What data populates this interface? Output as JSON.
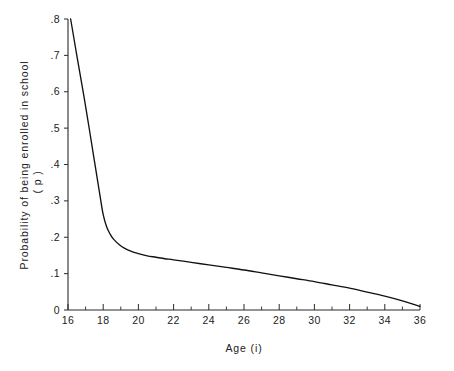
{
  "figure": {
    "background_color": "#ffffff",
    "line_color": "#111111",
    "axis_color": "#2a2a2a"
  },
  "axes": {
    "x_title": "Age (i)",
    "y_title_line1": "Probability of being enrolled in school",
    "y_title_line2": "( p )",
    "x_tick_labels": [
      "16",
      "18",
      "20",
      "22",
      "24",
      "26",
      "28",
      "30",
      "32",
      "34",
      "36"
    ],
    "y_tick_labels": [
      "0",
      ".1",
      ".2",
      ".3",
      ".4",
      ".5",
      ".6",
      ".7",
      ".8"
    ]
  },
  "chart_data": {
    "type": "line",
    "title": "",
    "xlabel": "Age (i)",
    "ylabel": "Probability of being enrolled in school ( p )",
    "xlim": [
      16,
      36
    ],
    "ylim": [
      0,
      0.8
    ],
    "grid": false,
    "legend": false,
    "x_major_ticks": [
      16,
      18,
      20,
      22,
      24,
      26,
      28,
      30,
      32,
      34,
      36
    ],
    "x_minor_ticks": [
      17,
      19,
      21,
      23,
      25,
      27,
      29,
      31,
      33,
      35
    ],
    "y_major_ticks": [
      0,
      0.1,
      0.2,
      0.3,
      0.4,
      0.5,
      0.6,
      0.7,
      0.8
    ],
    "series": [
      {
        "name": "Probability of being enrolled in school",
        "x": [
          16.15,
          16.5,
          17.0,
          17.5,
          17.8,
          18.0,
          18.2,
          18.4,
          18.6,
          18.9,
          19.2,
          19.6,
          20.0,
          20.5,
          21.0,
          21.5,
          22.0,
          23.0,
          24.0,
          25.0,
          26.0,
          27.0,
          28.0,
          29.0,
          30.0,
          31.0,
          32.0,
          33.0,
          34.0,
          35.0,
          36.0
        ],
        "y": [
          0.8,
          0.7,
          0.56,
          0.41,
          0.32,
          0.262,
          0.228,
          0.208,
          0.194,
          0.18,
          0.17,
          0.161,
          0.155,
          0.149,
          0.145,
          0.141,
          0.138,
          0.131,
          0.124,
          0.117,
          0.11,
          0.102,
          0.094,
          0.086,
          0.078,
          0.069,
          0.06,
          0.049,
          0.038,
          0.025,
          0.01
        ]
      }
    ]
  }
}
